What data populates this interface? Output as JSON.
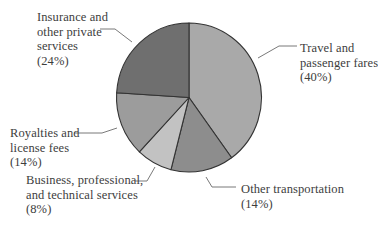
{
  "chart_data": {
    "type": "pie",
    "title": "",
    "start": "top",
    "direction": "clockwise",
    "slices": [
      {
        "label_lines": [
          "Travel and",
          "passenger fares"
        ],
        "pct_label": "(40%)",
        "value": 40,
        "color": "#a9a9a9"
      },
      {
        "label_lines": [
          "Other transportation"
        ],
        "pct_label": "(14%)",
        "value": 14,
        "color": "#8d8d8d"
      },
      {
        "label_lines": [
          "Business, professional,",
          "and technical services"
        ],
        "pct_label": "(8%)",
        "value": 8,
        "color": "#c2c2c2"
      },
      {
        "label_lines": [
          "Royalties and",
          "license fees"
        ],
        "pct_label": "(14%)",
        "value": 14,
        "color": "#9c9c9c"
      },
      {
        "label_lines": [
          "Insurance and",
          "other private",
          "services"
        ],
        "pct_label": "(24%)",
        "value": 24,
        "color": "#6f6f6f"
      }
    ],
    "edge_color": "#333333",
    "leader_color": "#6a6a6a"
  }
}
